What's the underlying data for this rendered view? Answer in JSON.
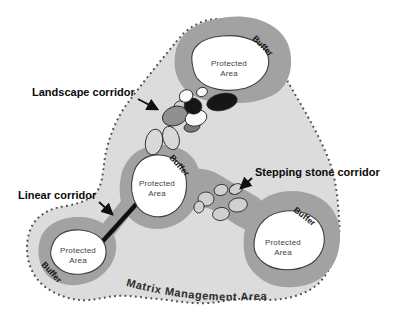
{
  "diagram": {
    "matrix": {
      "label": "Matrix Management Area"
    },
    "buffer_label": "Buffer",
    "protected_area": {
      "line1": "Protected",
      "line2": "Area"
    },
    "corridors": {
      "landscape": "Landscape corridor",
      "linear": "Linear corridor",
      "stepping_stone": "Stepping stone corridor"
    },
    "counts": {
      "protected_areas": 4,
      "buffers": 4,
      "stepping_stones": 6
    },
    "colors": {
      "background": "#ffffff",
      "matrix_fill": "#dcdcdc",
      "buffer_fill": "#a2a2a2",
      "protected_fill": "#ffffff",
      "stepping_stone_fill": "#d0d0d0",
      "linear_corridor_line": "#101010",
      "dotted_border": "#4d4d4d",
      "label_text": "#0a0a0a"
    }
  }
}
